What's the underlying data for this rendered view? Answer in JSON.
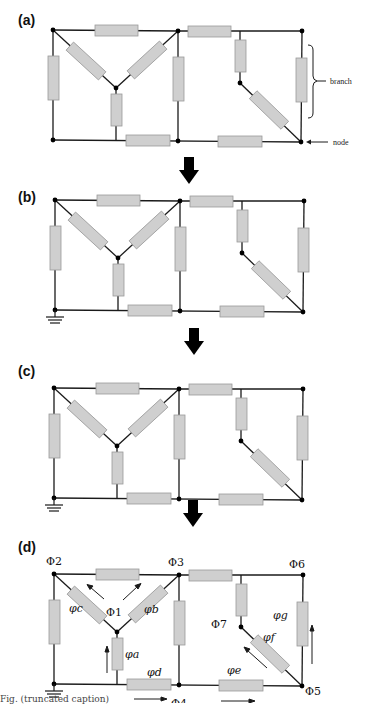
{
  "figure": {
    "panels": [
      {
        "label": "(a)",
        "annotations": {
          "branch": "branch",
          "node": "node"
        }
      },
      {
        "label": "(b)"
      },
      {
        "label": "(c)"
      },
      {
        "label": "(d)"
      }
    ],
    "potentials": {
      "phi1": "Φ1",
      "phi2": "Φ2",
      "phi3": "Φ3",
      "phi4": "Φ4",
      "phi5": "Φ5",
      "phi6": "Φ6",
      "phi7": "Φ7"
    },
    "branch_fluxes": {
      "a": "φa",
      "b": "φb",
      "c": "φc",
      "d": "φd",
      "e": "φe",
      "f": "φf",
      "g": "φg"
    },
    "colors": {
      "wire": "#1a1a1a",
      "resistor_fill": "#cfcfcf",
      "resistor_border": "#9a9a9a",
      "node": "#000000",
      "arrow": "#000000"
    },
    "caption": "Fig. (truncated caption)"
  }
}
